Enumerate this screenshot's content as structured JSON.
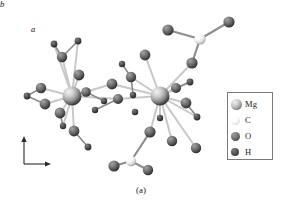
{
  "figure": {
    "caption": "(a)",
    "kind": "crystal-structure-ball-and-stick",
    "background_color": "#ffffff"
  },
  "axes": {
    "vertical_label": "b",
    "horizontal_label": "a"
  },
  "legend": {
    "items": [
      {
        "label": "Mg",
        "class": "b-mg",
        "size": "lg",
        "color": "#cfcfcf"
      },
      {
        "label": "C",
        "class": "b-c",
        "size": "sm",
        "color": "#f6f6f6"
      },
      {
        "label": "O",
        "class": "b-o",
        "size": "sm",
        "color": "#6a6a6a"
      },
      {
        "label": "H",
        "class": "b-h",
        "size": "xs",
        "color": "#3a3a3a"
      }
    ]
  },
  "chart_data": {
    "type": "scatter",
    "title": "",
    "xlabel": "a",
    "ylabel": "b",
    "atoms": [
      {
        "id": "Mg1",
        "element": "Mg",
        "x": 72,
        "y": 96,
        "r": 9.5
      },
      {
        "id": "Mg2",
        "element": "Mg",
        "x": 160,
        "y": 96,
        "r": 9.5
      },
      {
        "id": "O1",
        "element": "O",
        "x": 41,
        "y": 88,
        "r": 5.2
      },
      {
        "id": "O2",
        "element": "O",
        "x": 45,
        "y": 104,
        "r": 5.4
      },
      {
        "id": "O3",
        "element": "O",
        "x": 62,
        "y": 57,
        "r": 5.2
      },
      {
        "id": "O4",
        "element": "O",
        "x": 79,
        "y": 75,
        "r": 5.4
      },
      {
        "id": "O5",
        "element": "O",
        "x": 60,
        "y": 113,
        "r": 5.4
      },
      {
        "id": "O6",
        "element": "O",
        "x": 74,
        "y": 131,
        "r": 5.4
      },
      {
        "id": "O7",
        "element": "O",
        "x": 86,
        "y": 92,
        "r": 4.8
      },
      {
        "id": "O8",
        "element": "O",
        "x": 112,
        "y": 84,
        "r": 5.4
      },
      {
        "id": "O9",
        "element": "O",
        "x": 118,
        "y": 99,
        "r": 5.0
      },
      {
        "id": "O10",
        "element": "O",
        "x": 131,
        "y": 77,
        "r": 5.2
      },
      {
        "id": "O11",
        "element": "O",
        "x": 145,
        "y": 55,
        "r": 5.4
      },
      {
        "id": "O12",
        "element": "O",
        "x": 176,
        "y": 88,
        "r": 5.0
      },
      {
        "id": "O13",
        "element": "O",
        "x": 186,
        "y": 103,
        "r": 5.4
      },
      {
        "id": "O14",
        "element": "O",
        "x": 150,
        "y": 132,
        "r": 5.6
      },
      {
        "id": "O15",
        "element": "O",
        "x": 172,
        "y": 141,
        "r": 5.2
      },
      {
        "id": "O16",
        "element": "O",
        "x": 196,
        "y": 148,
        "r": 5.2
      },
      {
        "id": "O17",
        "element": "O",
        "x": 192,
        "y": 63,
        "r": 5.6
      },
      {
        "id": "O18",
        "element": "O",
        "x": 168,
        "y": 30,
        "r": 5.6
      },
      {
        "id": "O19",
        "element": "O",
        "x": 229,
        "y": 22,
        "r": 5.6
      },
      {
        "id": "O20",
        "element": "O",
        "x": 114,
        "y": 166,
        "r": 5.6
      },
      {
        "id": "O21",
        "element": "O",
        "x": 148,
        "y": 170,
        "r": 5.2
      },
      {
        "id": "C1",
        "element": "C",
        "x": 200,
        "y": 39,
        "r": 5.6
      },
      {
        "id": "C2",
        "element": "C",
        "x": 131,
        "y": 161,
        "r": 5.2
      },
      {
        "id": "H1",
        "element": "H",
        "x": 27,
        "y": 96,
        "r": 3.4
      },
      {
        "id": "H2",
        "element": "H",
        "x": 54,
        "y": 44,
        "r": 3.4
      },
      {
        "id": "H3",
        "element": "H",
        "x": 78,
        "y": 41,
        "r": 3.4
      },
      {
        "id": "H4",
        "element": "H",
        "x": 95,
        "y": 110,
        "r": 3.2
      },
      {
        "id": "H5",
        "element": "H",
        "x": 104,
        "y": 101,
        "r": 3.2
      },
      {
        "id": "H6",
        "element": "H",
        "x": 88,
        "y": 147,
        "r": 3.4
      },
      {
        "id": "H7",
        "element": "H",
        "x": 63,
        "y": 126,
        "r": 3.2
      },
      {
        "id": "H8",
        "element": "H",
        "x": 122,
        "y": 64,
        "r": 3.2
      },
      {
        "id": "H9",
        "element": "H",
        "x": 135,
        "y": 112,
        "r": 3.2
      },
      {
        "id": "H10",
        "element": "H",
        "x": 190,
        "y": 82,
        "r": 3.4
      },
      {
        "id": "H11",
        "element": "H",
        "x": 197,
        "y": 117,
        "r": 3.4
      },
      {
        "id": "H12",
        "element": "H",
        "x": 160,
        "y": 118,
        "r": 3.2
      },
      {
        "id": "H13",
        "element": "H",
        "x": 133,
        "y": 95,
        "r": 3.2
      }
    ],
    "bonds": [
      [
        "Mg1",
        "O1"
      ],
      [
        "Mg1",
        "O2"
      ],
      [
        "Mg1",
        "O3"
      ],
      [
        "Mg1",
        "O4"
      ],
      [
        "Mg1",
        "O5"
      ],
      [
        "Mg1",
        "O6"
      ],
      [
        "Mg1",
        "O7"
      ],
      [
        "Mg1",
        "H2"
      ],
      [
        "Mg1",
        "H3"
      ],
      [
        "Mg1",
        "H7"
      ],
      [
        "Mg1",
        "O8"
      ],
      [
        "Mg1",
        "O9"
      ],
      [
        "Mg2",
        "O10"
      ],
      [
        "Mg2",
        "O11"
      ],
      [
        "Mg2",
        "O12"
      ],
      [
        "Mg2",
        "O13"
      ],
      [
        "Mg2",
        "O14"
      ],
      [
        "Mg2",
        "O15"
      ],
      [
        "Mg2",
        "O16"
      ],
      [
        "Mg2",
        "O17"
      ],
      [
        "Mg2",
        "O8"
      ],
      [
        "Mg2",
        "O9"
      ],
      [
        "Mg2",
        "H10"
      ],
      [
        "Mg2",
        "H11"
      ],
      [
        "Mg2",
        "H12"
      ],
      [
        "O1",
        "H1"
      ],
      [
        "O2",
        "H1"
      ],
      [
        "O3",
        "H2"
      ],
      [
        "O3",
        "H3"
      ],
      [
        "O5",
        "H7"
      ],
      [
        "O6",
        "H6"
      ],
      [
        "O7",
        "H5"
      ],
      [
        "O9",
        "H4"
      ],
      [
        "O10",
        "H8"
      ],
      [
        "O10",
        "H13"
      ],
      [
        "O13",
        "H11"
      ],
      [
        "O12",
        "H10"
      ],
      [
        "C1",
        "O17"
      ],
      [
        "C1",
        "O18"
      ],
      [
        "C1",
        "O19"
      ],
      [
        "C2",
        "O20"
      ],
      [
        "C2",
        "O21"
      ],
      [
        "C2",
        "O14"
      ]
    ]
  }
}
